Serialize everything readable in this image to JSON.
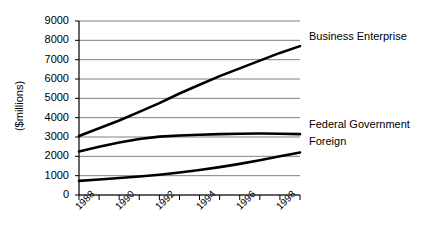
{
  "chart_data": {
    "type": "line",
    "title": "",
    "xlabel": "",
    "ylabel": "($millions)",
    "ylim": [
      0,
      9000
    ],
    "ytick_labels": [
      "9000",
      "8000",
      "7000",
      "6000",
      "5000",
      "4000",
      "3000",
      "2000",
      "1000",
      "0"
    ],
    "ytick_values": [
      9000,
      8000,
      7000,
      6000,
      5000,
      4000,
      3000,
      2000,
      1000,
      0
    ],
    "grid": true,
    "grid_axis": "y",
    "legend_position": "right-inline",
    "x": [
      1988,
      1989,
      1990,
      1991,
      1992,
      1993,
      1994,
      1995,
      1996,
      1997,
      1998,
      1999
    ],
    "xtick_labels": [
      "1988",
      "1990",
      "1992",
      "1994",
      "1996",
      "1998"
    ],
    "xtick_label_values": [
      1988,
      1990,
      1992,
      1994,
      1996,
      1998
    ],
    "xtick_rotation_deg": -45,
    "series": [
      {
        "name": "Business Enterprise",
        "color": "#000000",
        "values": [
          3050,
          3450,
          3850,
          4300,
          4750,
          5250,
          5700,
          6150,
          6550,
          6950,
          7350,
          7700
        ]
      },
      {
        "name": "Federal Government",
        "color": "#000000",
        "values": [
          2250,
          2500,
          2720,
          2900,
          3020,
          3080,
          3120,
          3150,
          3170,
          3180,
          3170,
          3150
        ]
      },
      {
        "name": "Foreign",
        "color": "#000000",
        "values": [
          730,
          800,
          880,
          960,
          1050,
          1160,
          1290,
          1440,
          1610,
          1800,
          2000,
          2200
        ]
      }
    ]
  },
  "series_labels": {
    "business_enterprise": "Business Enterprise",
    "federal_government": "Federal Government",
    "foreign": "Foreign"
  }
}
